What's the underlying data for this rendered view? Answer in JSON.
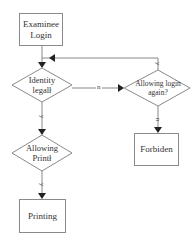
{
  "diagram": {
    "type": "flowchart",
    "nodes": {
      "login": {
        "label": "Examinee Login",
        "line1": "Examinee",
        "line2": "Login",
        "shape": "rectangle"
      },
      "identity": {
        "label": "Identity legal",
        "line1": "Identity",
        "line2": "legalł",
        "shape": "diamond"
      },
      "allow_login": {
        "label": "Allowing login again?",
        "line1": "Allowing login",
        "line2": "again?",
        "shape": "diamond"
      },
      "forbidden": {
        "label": "Forbiden",
        "shape": "rectangle"
      },
      "allow_print": {
        "label": "Allowing Print",
        "line1": "Allowing",
        "line2": "Printł",
        "shape": "diamond"
      },
      "printing": {
        "label": "Printing",
        "shape": "rectangle"
      }
    },
    "edges": [
      {
        "from": "login",
        "to": "identity",
        "label": ""
      },
      {
        "from": "identity",
        "to": "allow_login",
        "label": "n"
      },
      {
        "from": "identity",
        "to": "allow_print",
        "label": "y"
      },
      {
        "from": "allow_login",
        "to": "login",
        "label": "y"
      },
      {
        "from": "allow_login",
        "to": "forbidden",
        "label": "n"
      },
      {
        "from": "allow_print",
        "to": "printing",
        "label": "y"
      }
    ],
    "edge_labels": {
      "no": "n",
      "yes": "y"
    }
  }
}
